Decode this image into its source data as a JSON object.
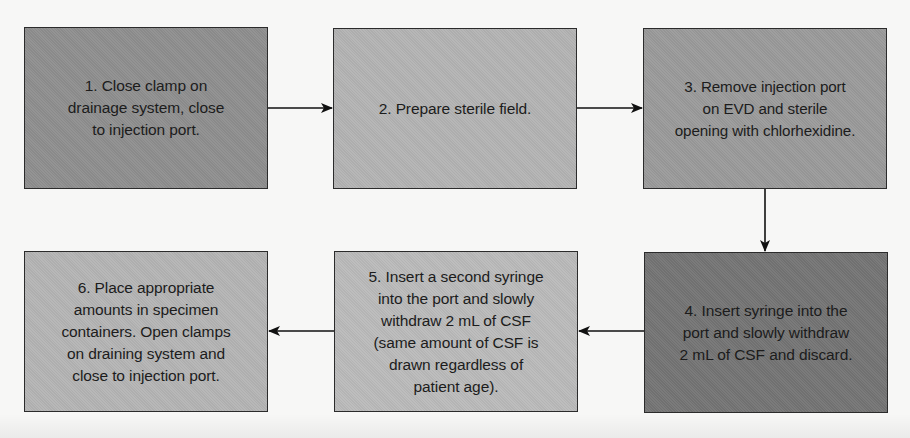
{
  "diagram": {
    "type": "flowchart",
    "flow_direction": "left-to-right on top row, down, then right-to-left on bottom row",
    "steps": [
      {
        "id": 1,
        "text": "1. Close clamp on\ndrainage system, close\nto injection port.",
        "fill": "#8e8e8e"
      },
      {
        "id": 2,
        "text": "2. Prepare sterile field.",
        "fill": "#b3b3b3"
      },
      {
        "id": 3,
        "text": "3. Remove injection port\non EVD and sterile\nopening with chlorhexidine.",
        "fill": "#9a9a9a"
      },
      {
        "id": 4,
        "text": "4. Insert syringe into the\nport and slowly withdraw\n2 mL of CSF and discard.",
        "fill": "#747474"
      },
      {
        "id": 5,
        "text": "5. Insert a second syringe\ninto the port and slowly\nwithdraw 2 mL of CSF\n(same amount of CSF is\ndrawn regardless of\npatient age).",
        "fill": "#bababa"
      },
      {
        "id": 6,
        "text": "6. Place appropriate\namounts in specimen\ncontainers. Open clamps\non draining system and\nclose to injection port.",
        "fill": "#b4b4b4"
      }
    ],
    "connections": [
      {
        "from": 1,
        "to": 2,
        "direction": "right"
      },
      {
        "from": 2,
        "to": 3,
        "direction": "right"
      },
      {
        "from": 3,
        "to": 4,
        "direction": "down"
      },
      {
        "from": 4,
        "to": 5,
        "direction": "left"
      },
      {
        "from": 5,
        "to": 6,
        "direction": "left"
      }
    ],
    "colors": {
      "border": "#2b2b2b",
      "arrow": "#111111",
      "text": "#1c1c1c",
      "background": "#f7f7f6"
    }
  }
}
